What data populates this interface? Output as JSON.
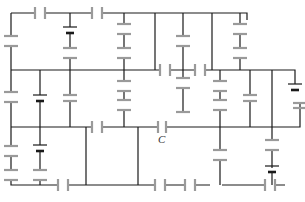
{
  "diagram": {
    "type": "circuit",
    "labels": [
      {
        "id": "C",
        "text": "C",
        "x": 160,
        "y": 132
      }
    ],
    "colors": {
      "wire": "#1a1a1a",
      "capacitor": "#9a9a9a",
      "battery": "#1a1a1a",
      "background": "#ffffff"
    },
    "component_counts": {
      "batteries": 5
    }
  }
}
